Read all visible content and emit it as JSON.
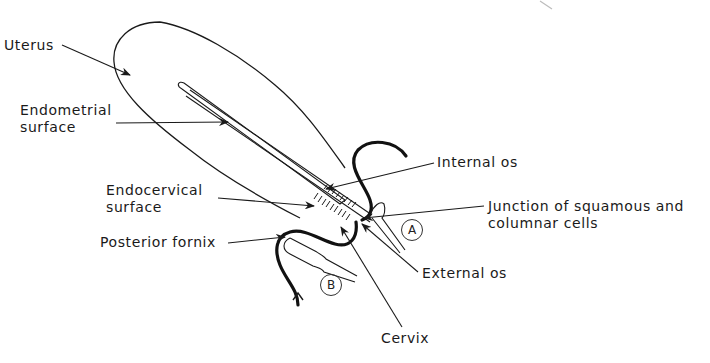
{
  "diagram": {
    "type": "anatomical-line-drawing",
    "colors": {
      "line": "#1a1a1a",
      "background": "#ffffff"
    },
    "labels": {
      "uterus": "Uterus",
      "endometrial_surface": [
        "Endometrial",
        "surface"
      ],
      "endocervical_surface": [
        "Endocervical",
        "surface"
      ],
      "posterior_fornix": "Posterior fornix",
      "internal_os": "Internal os",
      "junction": [
        "Junction of squamous and",
        "columnar cells"
      ],
      "external_os": "External os",
      "cervix": "Cervix"
    },
    "instruments": {
      "a": "A",
      "b": "B"
    }
  }
}
